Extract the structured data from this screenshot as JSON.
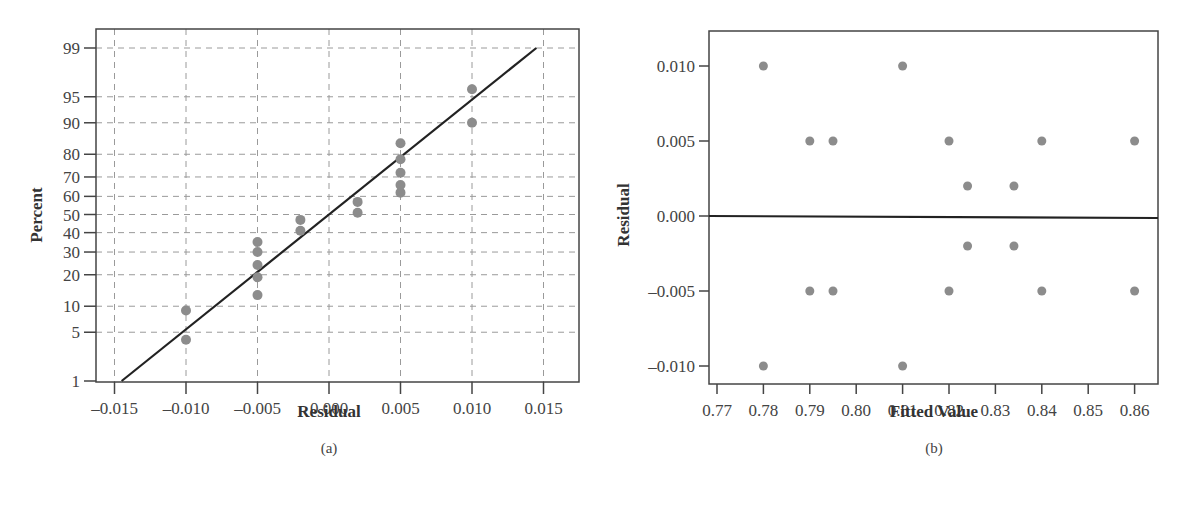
{
  "chart_data": [
    {
      "panel": "(a)",
      "type": "scatter",
      "subtype": "normal probability plot",
      "title": "",
      "xlabel": "Residual",
      "ylabel": "Percent",
      "xlim": [
        -0.0165,
        0.0165
      ],
      "yscale": "normal-probability",
      "xticks": [
        "-0.015",
        "-0.010",
        "-0.005",
        "0.000",
        "0.005",
        "0.010",
        "0.015"
      ],
      "xtick_values": [
        -0.015,
        -0.01,
        -0.005,
        0.0,
        0.005,
        0.01,
        0.015
      ],
      "yticks": [
        "1",
        "5",
        "10",
        "20",
        "30",
        "40",
        "50",
        "60",
        "70",
        "80",
        "90",
        "95",
        "99"
      ],
      "ytick_values": [
        1,
        5,
        10,
        20,
        30,
        40,
        50,
        60,
        70,
        80,
        90,
        95,
        99
      ],
      "grid": true,
      "grid_style": "dashed",
      "points": [
        {
          "x": -0.01,
          "y": 4
        },
        {
          "x": -0.01,
          "y": 9
        },
        {
          "x": -0.005,
          "y": 13
        },
        {
          "x": -0.005,
          "y": 19
        },
        {
          "x": -0.005,
          "y": 24
        },
        {
          "x": -0.005,
          "y": 30
        },
        {
          "x": -0.005,
          "y": 35
        },
        {
          "x": -0.002,
          "y": 41
        },
        {
          "x": -0.002,
          "y": 47
        },
        {
          "x": 0.002,
          "y": 51
        },
        {
          "x": 0.002,
          "y": 57
        },
        {
          "x": 0.005,
          "y": 62
        },
        {
          "x": 0.005,
          "y": 66
        },
        {
          "x": 0.005,
          "y": 72
        },
        {
          "x": 0.005,
          "y": 78
        },
        {
          "x": 0.005,
          "y": 84
        },
        {
          "x": 0.01,
          "y": 90
        },
        {
          "x": 0.01,
          "y": 96
        }
      ],
      "fit_line": {
        "from": {
          "x": -0.0145,
          "y": 1
        },
        "to": {
          "x": 0.0145,
          "y": 99
        }
      },
      "colors": {
        "points": "#8c8c8c",
        "line": "#222222",
        "grid": "#9a9a9a",
        "axis": "#444444"
      }
    },
    {
      "panel": "(b)",
      "type": "scatter",
      "subtype": "residuals vs fitted",
      "title": "",
      "xlabel": "Fitted Value",
      "ylabel": "Residual",
      "xlim": [
        0.7683,
        0.8652
      ],
      "ylim": [
        -0.0113,
        0.0123
      ],
      "xticks": [
        "0.77",
        "0.78",
        "0.79",
        "0.80",
        "0.81",
        "0.82",
        "0.83",
        "0.84",
        "0.85",
        "0.86"
      ],
      "xtick_values": [
        0.77,
        0.78,
        0.79,
        0.8,
        0.81,
        0.82,
        0.83,
        0.84,
        0.85,
        0.86
      ],
      "yticks": [
        "-0.010",
        "-0.005",
        "0.000",
        "0.005",
        "0.010"
      ],
      "ytick_values": [
        -0.01,
        -0.005,
        0.0,
        0.005,
        0.01
      ],
      "grid": false,
      "reference_line": {
        "y": 0.0
      },
      "points": [
        {
          "x": 0.78,
          "y": 0.01
        },
        {
          "x": 0.78,
          "y": -0.01
        },
        {
          "x": 0.79,
          "y": 0.005
        },
        {
          "x": 0.79,
          "y": -0.005
        },
        {
          "x": 0.795,
          "y": 0.005
        },
        {
          "x": 0.795,
          "y": -0.005
        },
        {
          "x": 0.81,
          "y": 0.01
        },
        {
          "x": 0.81,
          "y": -0.01
        },
        {
          "x": 0.82,
          "y": 0.005
        },
        {
          "x": 0.82,
          "y": -0.005
        },
        {
          "x": 0.824,
          "y": 0.002
        },
        {
          "x": 0.824,
          "y": -0.002
        },
        {
          "x": 0.834,
          "y": 0.002
        },
        {
          "x": 0.834,
          "y": -0.002
        },
        {
          "x": 0.84,
          "y": 0.005
        },
        {
          "x": 0.84,
          "y": -0.005
        },
        {
          "x": 0.86,
          "y": 0.005
        },
        {
          "x": 0.86,
          "y": -0.005
        }
      ],
      "colors": {
        "points": "#8c8c8c",
        "line": "#222222",
        "axis": "#444444"
      }
    }
  ]
}
